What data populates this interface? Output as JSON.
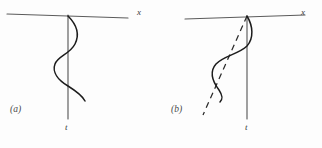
{
  "figure": {
    "background_color": "#fdfdfd",
    "ink_color": "#1c1c1c",
    "axis_color": "#5b5b5b",
    "panels": [
      {
        "id": "a",
        "caption": "(a)",
        "x_axis_label": "x",
        "t_axis_label": "t",
        "has_dashed_line": false,
        "x_axis": {
          "x1": 7,
          "y1": 14,
          "x2": 128,
          "y2": 18
        },
        "t_axis": {
          "x1": 68,
          "y1": 15,
          "x2": 68,
          "y2": 119
        },
        "curve_path": "M 68 16 C 76 24, 80 34, 75 44 C 70 54, 58 56, 55 64 C 52 72, 58 80, 68 86 C 76 91, 82 95, 85 101",
        "dashed_path": ""
      },
      {
        "id": "b",
        "caption": "(b)",
        "x_axis_label": "x",
        "t_axis_label": "t",
        "has_dashed_line": true,
        "x_axis": {
          "x1": 24,
          "y1": 19,
          "x2": 144,
          "y2": 15
        },
        "t_axis": {
          "x1": 86,
          "y1": 16,
          "x2": 86,
          "y2": 119
        },
        "curve_path": "M 86 16 C 92 26, 93 38, 86 46 C 78 54, 62 56, 55 64 C 48 72, 52 82, 58 90 C 62 96, 62 99, 59 102",
        "dashed_path": "M 86 16 L 42 115"
      }
    ]
  }
}
